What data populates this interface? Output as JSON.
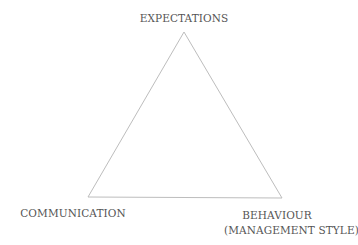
{
  "diagram": {
    "type": "triangle",
    "line_color": "#bdbdbd",
    "text_color": "#555555",
    "vertices": {
      "top": {
        "label": "EXPECTATIONS",
        "x": 184,
        "y": 32
      },
      "bottom_left": {
        "label": "COMMUNICATION",
        "x": 88,
        "y": 197
      },
      "bottom_right": {
        "label_line1": "BEHAVIOUR",
        "label_line2": "(MANAGEMENT STYLE)",
        "x": 282,
        "y": 198
      }
    }
  }
}
